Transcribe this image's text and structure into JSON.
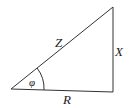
{
  "diagram": {
    "type": "right-triangle",
    "labels": {
      "hypotenuse": "Z",
      "vertical": "X",
      "horizontal": "R",
      "angle": "φ"
    },
    "colors": {
      "stroke": "#333333",
      "text": "#222222",
      "background": "#ffffff"
    }
  }
}
